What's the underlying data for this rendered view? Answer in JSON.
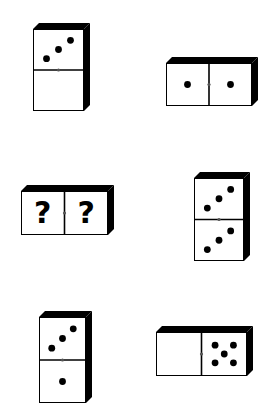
{
  "puzzle": {
    "type": "domino-sequence",
    "colors": {
      "face": "#ffffff",
      "edge": "#000000",
      "pip": "#000000",
      "background": "#ffffff"
    },
    "dominoes": [
      {
        "id": "d1",
        "orientation": "vertical",
        "halves": [
          3,
          0
        ],
        "position": {
          "x": 33,
          "y": 23,
          "faceW": 51,
          "faceH": 82,
          "depth": 6
        }
      },
      {
        "id": "d2",
        "orientation": "horizontal",
        "halves": [
          1,
          1
        ],
        "position": {
          "x": 166,
          "y": 57,
          "faceW": 86,
          "faceH": 43,
          "depth": 6
        }
      },
      {
        "id": "d3",
        "orientation": "horizontal",
        "halves": [
          "?",
          "?"
        ],
        "unknown_label": "?",
        "position": {
          "x": 21,
          "y": 185,
          "faceW": 87,
          "faceH": 44,
          "depth": 6
        }
      },
      {
        "id": "d4",
        "orientation": "vertical",
        "halves": [
          3,
          3
        ],
        "position": {
          "x": 194,
          "y": 172,
          "faceW": 50,
          "faceH": 83,
          "depth": 6
        }
      },
      {
        "id": "d5",
        "orientation": "vertical",
        "halves": [
          3,
          1
        ],
        "position": {
          "x": 39,
          "y": 311,
          "faceW": 47,
          "faceH": 86,
          "depth": 6
        }
      },
      {
        "id": "d6",
        "orientation": "horizontal",
        "halves": [
          0,
          5
        ],
        "position": {
          "x": 156,
          "y": 326,
          "faceW": 91,
          "faceH": 44,
          "depth": 6
        }
      }
    ]
  }
}
